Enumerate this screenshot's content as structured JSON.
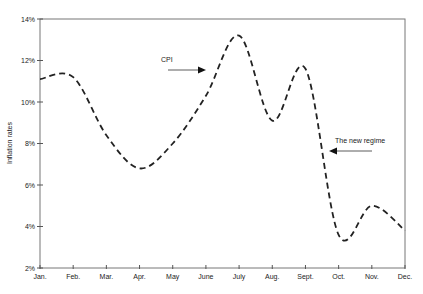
{
  "chart_data": {
    "type": "line",
    "title": "",
    "xlabel": "",
    "ylabel": "Inflation rates",
    "categories": [
      "Jan.",
      "Feb.",
      "Mar.",
      "Apr.",
      "May",
      "June",
      "July",
      "Aug.",
      "Sept.",
      "Oct.",
      "Nov.",
      "Dec."
    ],
    "series": [
      {
        "name": "CPI",
        "style": "dashed",
        "color": "#222222",
        "values": [
          11.1,
          11.2,
          8.4,
          6.8,
          8.0,
          10.3,
          13.2,
          9.1,
          11.6,
          3.6,
          5.0,
          3.8
        ]
      }
    ],
    "yticks": [
      "2%",
      "4%",
      "6%",
      "8%",
      "10%",
      "12%",
      "14%"
    ],
    "ylim": [
      2,
      14
    ],
    "grid": false,
    "legend": "none",
    "annotations": [
      {
        "text": "CPI",
        "arrow": "right",
        "target": "rising segment between June and July"
      },
      {
        "text": "The new regime",
        "arrow": "left",
        "target": "falling segment between Sept. and Oct."
      }
    ]
  }
}
